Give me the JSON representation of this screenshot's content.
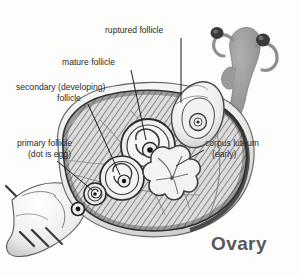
{
  "figure": {
    "caption": "Ovary",
    "style": "grayscale pen-and-ink anatomical illustration",
    "background_color": "#fdfdfc",
    "ink_color": "#1c1c1c",
    "caption_color": "#58585a",
    "tissue_fill": "#d8d8d6",
    "inset_fill": "#9a9a9a"
  },
  "labels": [
    {
      "id": "ruptured-follicle",
      "text": "ruptured follicle",
      "x": 105,
      "y": 33,
      "anchor": "start",
      "leader": "M 181 38 L 181 103"
    },
    {
      "id": "mature-follicle",
      "text": "mature follicle",
      "x": 62,
      "y": 65,
      "anchor": "start",
      "leader": "M 131 70 L 146 140"
    },
    {
      "id": "secondary-follicle-line1",
      "text": "secondary (developing)",
      "x": 16,
      "y": 90,
      "anchor": "start",
      "leader": ""
    },
    {
      "id": "secondary-follicle-line2",
      "text": "follicle",
      "x": 57,
      "y": 101,
      "anchor": "start",
      "leader": "M 88 104 L 120 175"
    },
    {
      "id": "primary-follicle-line1",
      "text": "primary follicle",
      "x": 17,
      "y": 146,
      "anchor": "start",
      "leader": ""
    },
    {
      "id": "primary-follicle-line2",
      "text": "(dot is egg)",
      "x": 28,
      "y": 157,
      "anchor": "start",
      "leader": "M 57 161 L 95 191"
    },
    {
      "id": "corpus-luteum-line1",
      "text": "corpus luteum",
      "x": 205,
      "y": 146,
      "anchor": "start",
      "leader": ""
    },
    {
      "id": "corpus-luteum-line2",
      "text": "(early)",
      "x": 212,
      "y": 157,
      "anchor": "start",
      "leader": "M 204 150 L 175 165"
    }
  ],
  "structures": [
    {
      "id": "ovary-body",
      "name": "ovary-body",
      "description": "hatched oval ovarian stroma"
    },
    {
      "id": "mature-follicle",
      "name": "mature-follicle",
      "description": "large concentric ringed follicle with central dark egg"
    },
    {
      "id": "secondary-follicle",
      "name": "secondary-follicle",
      "description": "medium concentric ringed developing follicle with egg dot"
    },
    {
      "id": "primary-follicle-large",
      "name": "primary-follicle",
      "description": "small spiral follicle"
    },
    {
      "id": "primary-follicle-small",
      "name": "primary-follicle",
      "description": "tiny dot follicle (egg)"
    },
    {
      "id": "ruptured-follicle",
      "name": "ruptured-follicle",
      "description": "open follicle at ovary surface releasing egg"
    },
    {
      "id": "corpus-luteum",
      "name": "corpus-luteum",
      "description": "lobed flower-shaped yellow body"
    },
    {
      "id": "ligament",
      "name": "supporting-ligament",
      "description": "pale folded ligament at lower left"
    },
    {
      "id": "uterus-inset",
      "name": "uterus-inset",
      "description": "small gray uterus and tubes orientation figure, top right"
    }
  ]
}
